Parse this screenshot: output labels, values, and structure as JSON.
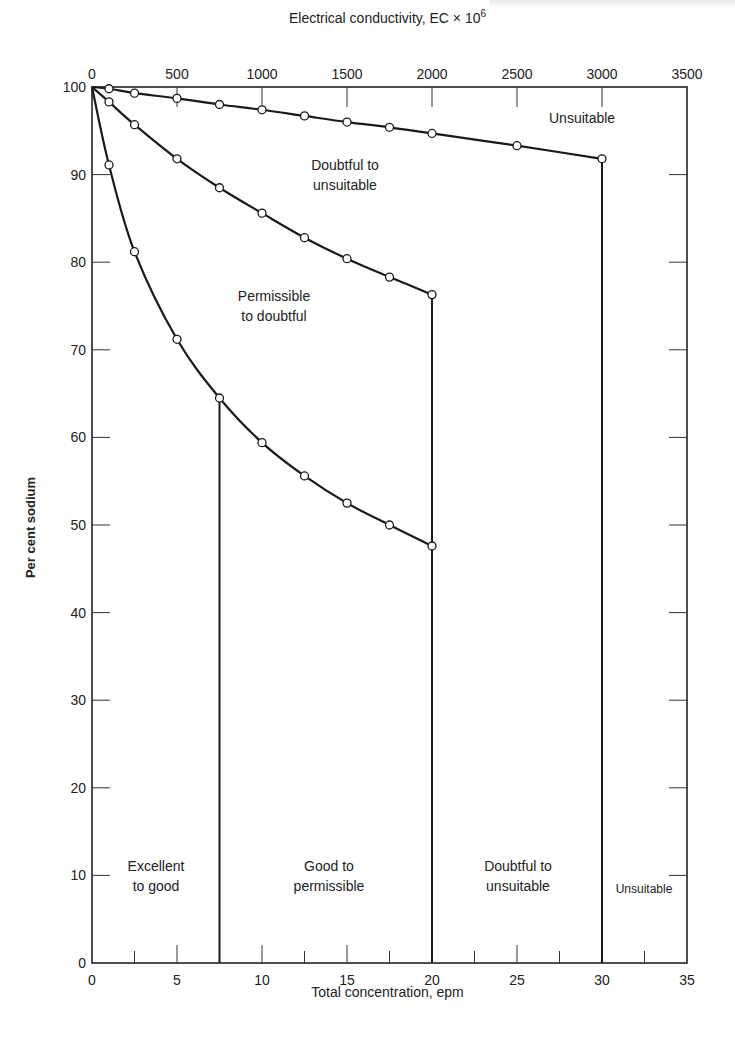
{
  "chart_data": {
    "type": "line",
    "title": "",
    "xlabel": "Total concentration, epm",
    "x2label": "Electrical conductivity, EC × 10⁶",
    "ylabel": "Per cent sodium",
    "xlim": [
      0,
      35
    ],
    "x2lim": [
      0,
      3500
    ],
    "ylim": [
      0,
      100
    ],
    "x_ticks": [
      0,
      5,
      10,
      15,
      20,
      25,
      30,
      35
    ],
    "x2_ticks": [
      0,
      500,
      1000,
      1500,
      2000,
      2500,
      3000,
      3500
    ],
    "y_ticks": [
      0,
      10,
      20,
      30,
      40,
      50,
      60,
      70,
      80,
      90,
      100
    ],
    "grid": false,
    "series": [
      {
        "name": "Unsuitable / Doubtful to unsuitable boundary",
        "x_units": "EC x 10^6",
        "x": [
          0,
          100,
          250,
          500,
          750,
          1000,
          1250,
          1500,
          1750,
          2000,
          2500,
          3000
        ],
        "y": [
          100,
          99.8,
          99.3,
          98.7,
          98.0,
          97.4,
          96.7,
          96.0,
          95.4,
          94.7,
          93.3,
          91.8
        ]
      },
      {
        "name": "Doubtful to unsuitable / Permissible to doubtful boundary",
        "x_units": "epm",
        "x": [
          0,
          1,
          2.5,
          5,
          7.5,
          10,
          12.5,
          15,
          17.5,
          20
        ],
        "y": [
          100,
          98.3,
          95.7,
          91.8,
          88.5,
          85.6,
          82.8,
          80.4,
          78.3,
          76.3
        ]
      },
      {
        "name": "Permissible to doubtful / Good to permissible boundary",
        "x_units": "epm",
        "x": [
          0,
          1,
          2.5,
          5,
          7.5,
          10,
          12.5,
          15,
          17.5,
          20
        ],
        "y": [
          100,
          91.1,
          81.2,
          71.2,
          64.5,
          59.4,
          55.6,
          52.5,
          50.0,
          47.6
        ]
      }
    ],
    "vertical_boundaries": [
      {
        "x_epm": 7.5,
        "y_top": 64.5
      },
      {
        "x_epm": 20,
        "y_top": 76.3
      },
      {
        "x_epm": 30,
        "y_top": 91.8
      }
    ],
    "annotations": [
      {
        "text": "Unsuitable",
        "x_epm": 26.2,
        "y": 96.5
      },
      {
        "text": "Doubtful to unsuitable",
        "x_epm": 14.8,
        "y": 91
      },
      {
        "text": "Permissible to doubtful",
        "x_epm": 10.7,
        "y": 74
      },
      {
        "text": "Excellent to good",
        "x_epm": 3.7,
        "y": 10
      },
      {
        "text": "Good to permissible",
        "x_epm": 13.8,
        "y": 10
      },
      {
        "text": "Doubtful to unsuitable",
        "x_epm": 25.5,
        "y": 10
      },
      {
        "text": "Unsuitable",
        "x_epm": 32.5,
        "y": 9
      }
    ]
  },
  "axes": {
    "top_title": "Electrical conductivity, EC × 10",
    "top_title_exp": "6",
    "bottom_title": "Total concentration, epm",
    "left_title": "Per cent sodium"
  },
  "regions": {
    "top_unsuitable": "Unsuitable",
    "upper_doubtful_l1": "Doubtful to",
    "upper_doubtful_l2": "unsuitable",
    "permissible_l1": "Permissible",
    "permissible_l2": "to doubtful",
    "excellent_l1": "Excellent",
    "excellent_l2": "to good",
    "good_l1": "Good to",
    "good_l2": "permissible",
    "lower_doubtful_l1": "Doubtful to",
    "lower_doubtful_l2": "unsuitable",
    "lower_unsuitable": "Unsuitable"
  },
  "ticks": {
    "x": [
      "0",
      "5",
      "10",
      "15",
      "20",
      "25",
      "30",
      "35"
    ],
    "x2": [
      "0",
      "500",
      "1000",
      "1500",
      "2000",
      "2500",
      "3000",
      "3500"
    ],
    "y": [
      "0",
      "10",
      "20",
      "30",
      "40",
      "50",
      "60",
      "70",
      "80",
      "90",
      "100"
    ]
  }
}
